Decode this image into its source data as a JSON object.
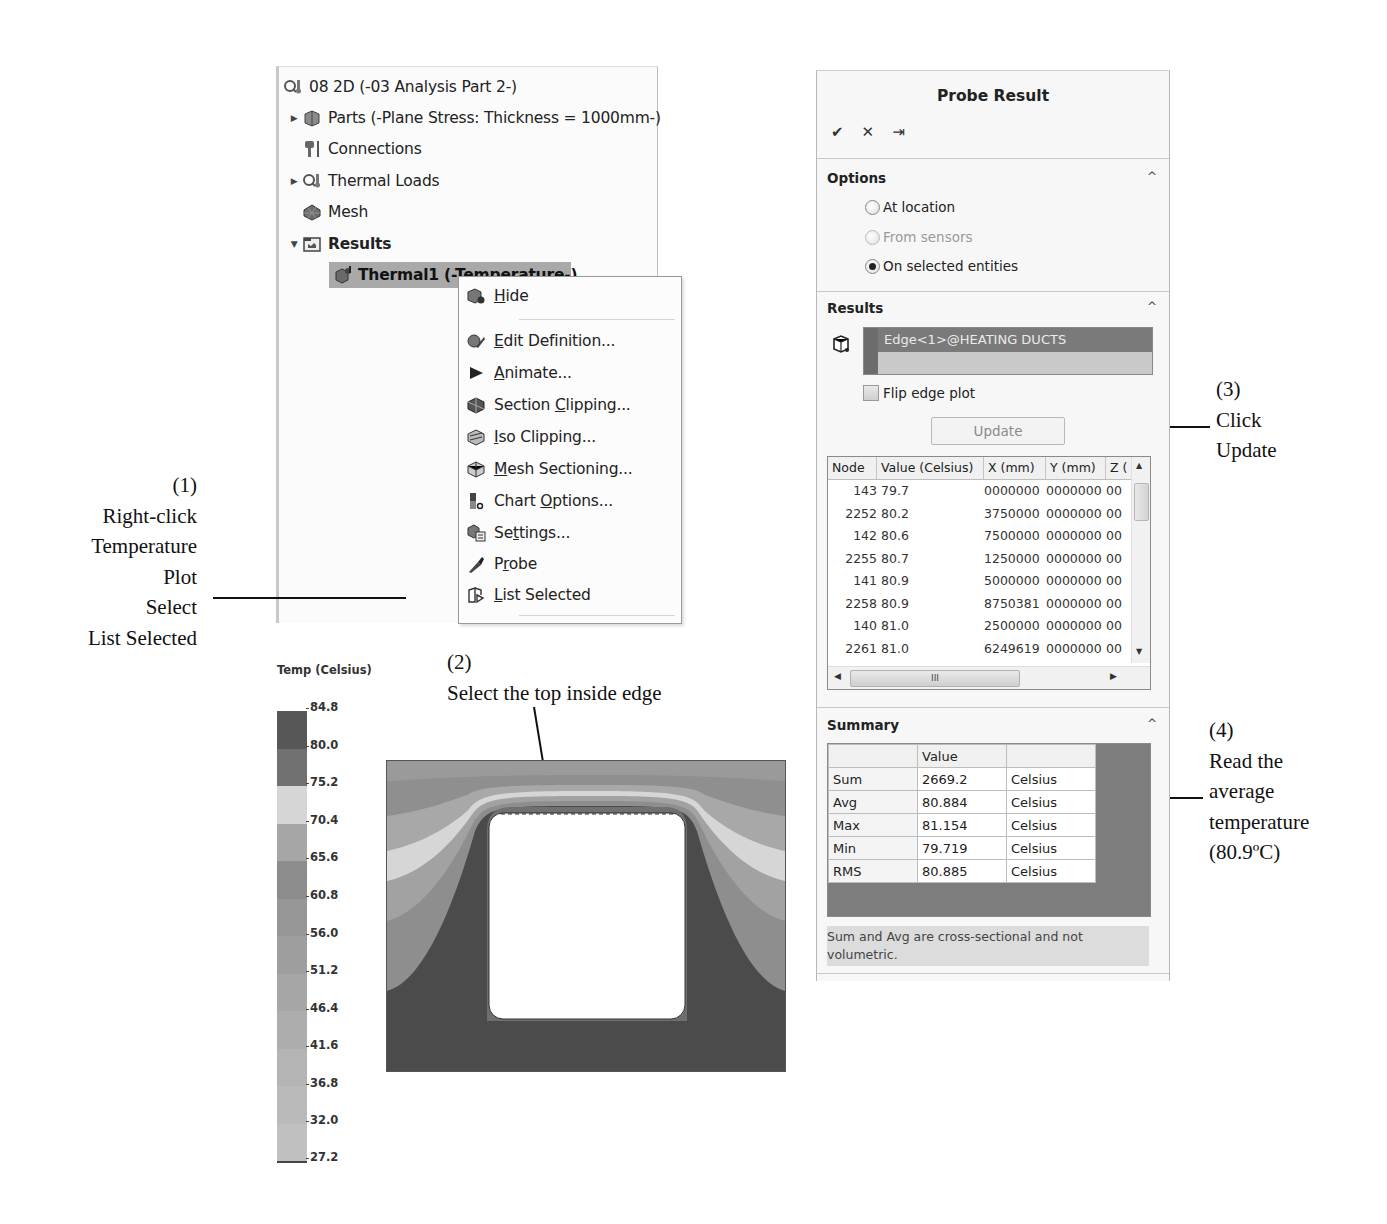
{
  "tree": {
    "root": "08 2D (-03 Analysis Part 2-)",
    "items": [
      {
        "label": "Parts (-Plane Stress: Thickness = 1000mm-)",
        "expander": "collapsed",
        "icon": "parts-icon"
      },
      {
        "label": "Connections",
        "expander": "none",
        "icon": "connections-icon"
      },
      {
        "label": "Thermal Loads",
        "expander": "collapsed",
        "icon": "thermal-loads-icon"
      },
      {
        "label": "Mesh",
        "expander": "none",
        "icon": "mesh-icon"
      },
      {
        "label": "Results",
        "expander": "expanded",
        "icon": "results-folder-icon"
      },
      {
        "label": "Thermal1 (-Temperature-)",
        "expander": "none",
        "icon": "thermal-plot-icon",
        "selected": true
      }
    ]
  },
  "context_menu": {
    "items": [
      {
        "label": "Hide",
        "mnemonic": "H",
        "icon": "hide-icon"
      },
      {
        "label": "Edit Definition...",
        "mnemonic": "E",
        "icon": "edit-definition-icon"
      },
      {
        "label": "Animate...",
        "mnemonic": "A",
        "icon": "play-icon"
      },
      {
        "label": "Section Clipping...",
        "mnemonic": "C",
        "icon": "section-clipping-icon"
      },
      {
        "label": "Iso Clipping...",
        "mnemonic": "I",
        "icon": "iso-clipping-icon"
      },
      {
        "label": "Mesh Sectioning...",
        "mnemonic": "M",
        "icon": "mesh-sectioning-icon"
      },
      {
        "label": "Chart Options...",
        "mnemonic": "O",
        "icon": "chart-options-icon"
      },
      {
        "label": "Settings...",
        "mnemonic": "t",
        "icon": "settings-icon"
      },
      {
        "label": "Probe",
        "mnemonic": "r",
        "icon": "probe-icon"
      },
      {
        "label": "List Selected",
        "mnemonic": "L",
        "icon": "list-selected-icon"
      }
    ]
  },
  "annotations": {
    "step1": [
      "(1)",
      "Right-click",
      "Temperature",
      "Plot",
      "Select",
      "List Selected"
    ],
    "step2": [
      "(2)",
      "Select the top inside edge"
    ],
    "step3": [
      "(3)",
      "Click",
      "Update"
    ],
    "step4": [
      "(4)",
      "Read the",
      "average",
      "temperature",
      "(80.9ºC)"
    ]
  },
  "legend": {
    "title": "Temp (Celsius)",
    "ticks": [
      "84.8",
      "80.0",
      "75.2",
      "70.4",
      "65.6",
      "60.8",
      "56.0",
      "51.2",
      "46.4",
      "41.6",
      "36.8",
      "32.0",
      "27.2"
    ],
    "colors": [
      "#575757",
      "#6f6f6f",
      "#d9d9d9",
      "#a4a4a4",
      "#8b8b8b",
      "#999999",
      "#a3a3a3",
      "#ababab",
      "#b2b2b2",
      "#b9b9b9",
      "#bebebe",
      "#c3c3c3"
    ]
  },
  "probe": {
    "title": "Probe Result",
    "actions": {
      "ok": "✔",
      "cancel": "✕",
      "pin": "⇥"
    },
    "options": {
      "title": "Options",
      "radios": [
        {
          "label": "At location",
          "checked": false,
          "disabled": false
        },
        {
          "label": "From sensors",
          "checked": false,
          "disabled": true
        },
        {
          "label": "On selected entities",
          "checked": true,
          "disabled": false
        }
      ]
    },
    "results": {
      "title": "Results",
      "selection": "Edge<1>@HEATING DUCTS",
      "flip_label": "Flip edge plot",
      "update_label": "Update",
      "columns": [
        "Node",
        "Value (Celsius)",
        "X (mm)",
        "Y (mm)",
        "Z ("
      ],
      "rows": [
        {
          "node": "143",
          "value": "79.7",
          "x": "0000000",
          "y": "0000000",
          "z": "00"
        },
        {
          "node": "2252",
          "value": "80.2",
          "x": "3750000",
          "y": "0000000",
          "z": "00"
        },
        {
          "node": "142",
          "value": "80.6",
          "x": "7500000",
          "y": "0000000",
          "z": "00"
        },
        {
          "node": "2255",
          "value": "80.7",
          "x": "1250000",
          "y": "0000000",
          "z": "00"
        },
        {
          "node": "141",
          "value": "80.9",
          "x": "5000000",
          "y": "0000000",
          "z": "00"
        },
        {
          "node": "2258",
          "value": "80.9",
          "x": "8750381",
          "y": "0000000",
          "z": "00"
        },
        {
          "node": "140",
          "value": "81.0",
          "x": "2500000",
          "y": "0000000",
          "z": "00"
        },
        {
          "node": "2261",
          "value": "81.0",
          "x": "6249619",
          "y": "0000000",
          "z": "00"
        }
      ],
      "hscroll_grip": "III"
    },
    "summary": {
      "title": "Summary",
      "header": [
        "",
        "Value",
        ""
      ],
      "rows": [
        {
          "label": "Sum",
          "value": "2669.2",
          "unit": "Celsius"
        },
        {
          "label": "Avg",
          "value": "80.884",
          "unit": "Celsius"
        },
        {
          "label": "Max",
          "value": "81.154",
          "unit": "Celsius"
        },
        {
          "label": "Min",
          "value": "79.719",
          "unit": "Celsius"
        },
        {
          "label": "RMS",
          "value": "80.885",
          "unit": "Celsius"
        }
      ],
      "note": "Sum and Avg are cross-sectional and not volumetric."
    },
    "collapse_glyph": "^"
  }
}
